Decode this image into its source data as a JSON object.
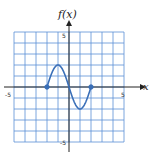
{
  "chart_data": {
    "type": "line",
    "title": "",
    "xlabel": "x",
    "ylabel": "f(x)",
    "xlim": [
      -5,
      5
    ],
    "ylim": [
      -5,
      5
    ],
    "grid": true,
    "grid_step": 1,
    "x_tick_labels": [
      "-5",
      "5"
    ],
    "y_tick_labels": [
      "5",
      "-5"
    ],
    "series": [
      {
        "name": "f(x)",
        "x": [
          -2,
          -1.5,
          -1,
          -0.5,
          0,
          0.5,
          1,
          1.5,
          2
        ],
        "y": [
          0,
          1.6,
          2,
          1.4,
          0,
          -1.4,
          -2,
          -1.6,
          0
        ],
        "endpoints": [
          {
            "x": -2,
            "y": 0,
            "closed": true
          },
          {
            "x": 2,
            "y": 0,
            "closed": true
          }
        ]
      }
    ]
  },
  "labels": {
    "y_axis": "f(x)",
    "x_axis": "x",
    "x_min": "-5",
    "x_max": "5",
    "y_max": "5",
    "y_min": "-5"
  },
  "colors": {
    "grid": "#5b8fd6",
    "curve": "#3a6fb8",
    "axis": "#222222",
    "background": "#ffffff"
  }
}
